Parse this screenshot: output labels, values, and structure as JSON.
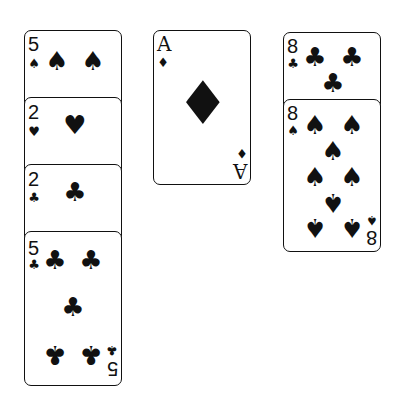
{
  "columns": [
    {
      "name": "left",
      "cards": [
        {
          "rank": "5",
          "suit": "spades",
          "glyph": "♠"
        },
        {
          "rank": "2",
          "suit": "hearts",
          "glyph": "♥"
        },
        {
          "rank": "2",
          "suit": "clubs",
          "glyph": "♣"
        },
        {
          "rank": "5",
          "suit": "clubs",
          "glyph": "♣"
        }
      ]
    },
    {
      "name": "middle",
      "cards": [
        {
          "rank": "A",
          "suit": "diamonds",
          "glyph": "♦"
        }
      ]
    },
    {
      "name": "right",
      "cards": [
        {
          "rank": "8",
          "suit": "clubs",
          "glyph": "♣"
        },
        {
          "rank": "8",
          "suit": "spades",
          "glyph": "♠"
        }
      ]
    }
  ]
}
